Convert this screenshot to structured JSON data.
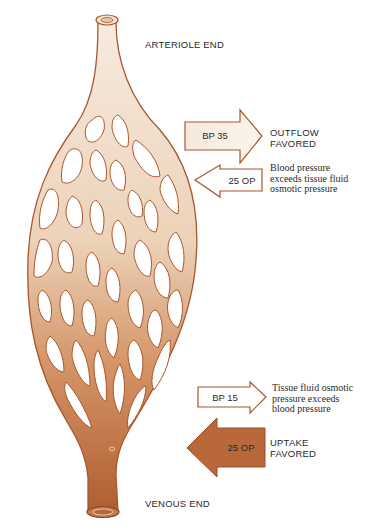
{
  "labels": {
    "arteriole_end": "ARTERIOLE END",
    "venous_end": "VENOUS END"
  },
  "arterial_side": {
    "outward_arrow": {
      "label": "BP 35",
      "direction": "right"
    },
    "inward_arrow": {
      "label": "25 OP",
      "direction": "left"
    },
    "result": [
      "OUTFLOW",
      "FAVORED"
    ],
    "explanation": [
      "Blood pressure",
      "exceeds tissue fluid",
      "osmotic pressure"
    ]
  },
  "venous_side": {
    "outward_arrow": {
      "label": "BP 15",
      "direction": "right"
    },
    "inward_arrow": {
      "label": "25 OP",
      "direction": "left"
    },
    "result": [
      "UPTAKE",
      "FAVORED"
    ],
    "explanation": [
      "Tissue fluid osmotic",
      "pressure exceeds",
      "blood pressure"
    ]
  },
  "colors": {
    "arterial_fill": "#f3e3d2",
    "venous_fill": "#b8683a",
    "outline": "#a9562e",
    "text": "#2a2a2a"
  }
}
